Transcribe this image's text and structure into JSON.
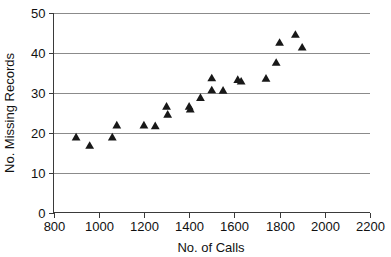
{
  "chart_data": {
    "type": "scatter",
    "title": "",
    "xlabel": "No. of Calls",
    "ylabel": "No. Missing Records",
    "xlim": [
      800,
      2200
    ],
    "ylim": [
      0,
      50
    ],
    "xticks": [
      800,
      1000,
      1200,
      1400,
      1600,
      1800,
      2000,
      2200
    ],
    "yticks": [
      0,
      10,
      20,
      30,
      40,
      50
    ],
    "grid": "horizontal",
    "legend": "none",
    "marker": "triangle-up",
    "marker_color": "#181818",
    "series": [
      {
        "name": "Missing records vs calls",
        "points": [
          [
            900,
            18.8
          ],
          [
            960,
            16.7
          ],
          [
            1060,
            18.8
          ],
          [
            1080,
            21.8
          ],
          [
            1200,
            21.8
          ],
          [
            1250,
            21.6
          ],
          [
            1300,
            26.5
          ],
          [
            1305,
            24.5
          ],
          [
            1400,
            26.5
          ],
          [
            1405,
            25.8
          ],
          [
            1450,
            28.7
          ],
          [
            1500,
            33.6
          ],
          [
            1500,
            30.6
          ],
          [
            1550,
            30.5
          ],
          [
            1615,
            33.2
          ],
          [
            1630,
            32.8
          ],
          [
            1740,
            33.5
          ],
          [
            1785,
            37.5
          ],
          [
            1800,
            42.5
          ],
          [
            1870,
            44.5
          ],
          [
            1900,
            41.3
          ]
        ]
      }
    ]
  },
  "axes": {
    "x_tick_labels": [
      "800",
      "1000",
      "1200",
      "1400",
      "1600",
      "1800",
      "2000",
      "2200"
    ],
    "y_tick_labels": [
      "0",
      "10",
      "20",
      "30",
      "40",
      "50"
    ],
    "x_axis_title": "No. of Calls",
    "y_axis_title": "No. Missing Records"
  }
}
